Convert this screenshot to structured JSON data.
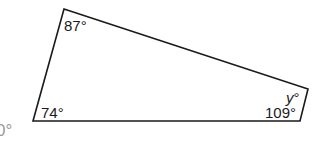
{
  "diagram": {
    "shape": "quadrilateral",
    "vertices": {
      "top_left": [
        64,
        9
      ],
      "right": [
        308,
        89
      ],
      "bottom_right": [
        300,
        121
      ],
      "bottom_left": [
        33,
        121
      ]
    },
    "stroke_color": "#1a1a1a",
    "angles": {
      "top_left": "87°",
      "bottom_left": "74°",
      "bottom_right": "109°",
      "right_var": "y",
      "right_deg": "°"
    },
    "clipped_fragment": "0°"
  }
}
